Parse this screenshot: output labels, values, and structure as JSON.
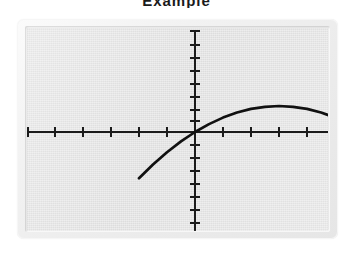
{
  "title_remnant": "Example",
  "screen": {
    "device_label": "graphing-calculator-screen",
    "bezel_color": "#ececec",
    "lcd_color": "#e3e3e3",
    "ink_color": "#111111"
  },
  "chart_data": {
    "type": "line",
    "title": "",
    "subtitle": "",
    "xlabel": "",
    "ylabel": "",
    "grid": false,
    "legend": null,
    "legend_position": "none",
    "axes": {
      "x_axis_visible": true,
      "y_axis_visible": true,
      "x_axis_range_units": [
        -5.6,
        10.5
      ],
      "y_axis_range_units": [
        -7.3,
        3.6
      ],
      "x_tick_count_left": 5,
      "x_tick_count_right": 5,
      "y_tick_count_above": 7,
      "y_tick_count_below": 7,
      "tick_spacing_units": 1,
      "tick_labels_shown": false
    },
    "series": [
      {
        "name": "y = -0.222x^2 + 1.333x",
        "equation": "y = -0.222x^2 + 1.333x",
        "color": "#111111",
        "vertex": [
          3.0,
          2.0
        ],
        "roots": [
          0.0,
          6.0
        ],
        "opens": "down",
        "x": [
          -2.0,
          -1.5,
          -1.0,
          -0.5,
          0.0,
          0.5,
          1.0,
          1.5,
          2.0,
          2.5,
          3.0,
          3.5,
          4.0,
          4.5,
          5.0,
          5.5,
          6.0,
          6.5,
          7.0,
          7.5,
          8.0,
          8.5,
          9.0
        ],
        "values": [
          -3.56,
          -2.5,
          -1.56,
          -0.72,
          0.0,
          0.61,
          1.11,
          1.5,
          1.78,
          1.94,
          2.0,
          1.94,
          1.78,
          1.5,
          1.11,
          0.61,
          0.0,
          -0.72,
          -1.56,
          -2.5,
          -3.56,
          -4.72,
          -6.0
        ]
      }
    ]
  }
}
